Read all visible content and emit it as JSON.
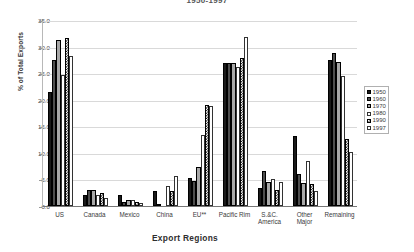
{
  "chart_data": {
    "type": "bar",
    "title": "1950-1997",
    "xlabel": "Export Regions",
    "ylabel": "% of Total Exports",
    "ylim": [
      0,
      35
    ],
    "yticks": [
      "0.0",
      "5.0",
      "10.0",
      "15.0",
      "20.0",
      "25.0",
      "30.0",
      "35.0"
    ],
    "grid": true,
    "legend_position": "right",
    "categories": [
      "US",
      "Canada",
      "Mexico",
      "China",
      "EU**",
      "Pacific Rim",
      "S.&C.\nAmerica",
      "Other\nMajor",
      "Remaining"
    ],
    "category_labels": [
      {
        "line1": "US",
        "line2": ""
      },
      {
        "line1": "Canada",
        "line2": ""
      },
      {
        "line1": "Mexico",
        "line2": ""
      },
      {
        "line1": "China",
        "line2": ""
      },
      {
        "line1": "EU**",
        "line2": ""
      },
      {
        "line1": "Pacific Rim",
        "line2": ""
      },
      {
        "line1": "S.&C.",
        "line2": "America"
      },
      {
        "line1": "Other",
        "line2": "Major"
      },
      {
        "line1": "Remaining",
        "line2": ""
      }
    ],
    "series": [
      {
        "name": "1950",
        "fill": "solid-black",
        "color": "#1a1a1a",
        "values": [
          21.5,
          2.0,
          2.0,
          2.8,
          5.3,
          26.9,
          3.3,
          13.1,
          27.5
        ]
      },
      {
        "name": "1960",
        "fill": "solid-darkgray",
        "color": "#4f4f4f",
        "values": [
          27.4,
          3.1,
          0.8,
          0.3,
          4.8,
          26.9,
          6.5,
          6.1,
          28.8
        ]
      },
      {
        "name": "1970",
        "fill": "solid-gray",
        "color": "#a8a8a8",
        "values": [
          31.2,
          3.1,
          1.2,
          0.0,
          7.3,
          26.9,
          4.5,
          4.3,
          27.1
        ]
      },
      {
        "name": "1980",
        "fill": "white",
        "color": "#ffffff",
        "values": [
          24.6,
          2.1,
          1.1,
          3.7,
          13.4,
          26.1,
          5.1,
          8.4,
          24.5
        ]
      },
      {
        "name": "1990",
        "fill": "checker",
        "color": "#000000",
        "values": [
          31.7,
          2.4,
          0.8,
          2.9,
          19.1,
          27.9,
          3.0,
          4.1,
          12.6
        ]
      },
      {
        "name": "1997",
        "fill": "dotted",
        "color": "#555555",
        "values": [
          28.2,
          1.6,
          0.6,
          5.6,
          18.9,
          31.8,
          4.6,
          2.8,
          10.1
        ]
      }
    ]
  },
  "legend": {
    "items": [
      "1950",
      "1960",
      "1970",
      "1980",
      "1990",
      "1997"
    ]
  }
}
